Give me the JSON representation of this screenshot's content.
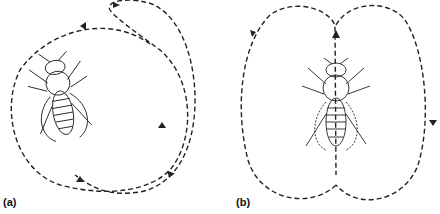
{
  "figure": {
    "panels": [
      {
        "id": "a",
        "label": "(a)",
        "description": "round dance: bee with circular dashed path"
      },
      {
        "id": "b",
        "label": "(b)",
        "description": "waggle/figure-eight style path: two loops around bee with straight run through body"
      }
    ],
    "colors": {
      "line": "#222222",
      "background": "#ffffff"
    }
  }
}
